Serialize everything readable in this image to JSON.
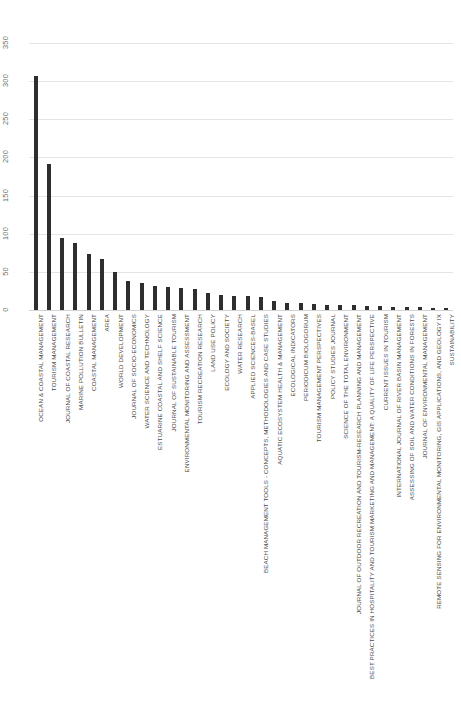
{
  "chart_data": {
    "type": "bar",
    "title": "",
    "subtitle": "",
    "xlabel": "",
    "ylabel": "",
    "ylim": [
      0,
      350
    ],
    "yticks": [
      0,
      50,
      100,
      150,
      200,
      250,
      300,
      350
    ],
    "ytick_labels": [
      "0",
      "50",
      "100",
      "150",
      "200",
      "250",
      "300",
      "350"
    ],
    "grid": true,
    "grid_axis": "y",
    "legend": false,
    "orientation": "vertical",
    "bar_color": "#2e2e2e",
    "grid_color": "#e4e4e4",
    "categories": [
      "OCEAN & COASTAL MANAGEMENT",
      "TOURISM MANAGEMENT",
      "JOURNAL OF COASTAL RESEARCH",
      "MARINE POLLUTION BULLETIN",
      "COASTAL MANAGEMENT",
      "AREA",
      "WORLD DEVELOPMENT",
      "JOURNAL OF SOCIO-ECONOMICS",
      "WATER SCIENCE AND TECHNOLOGY",
      "ESTUARINE COASTAL AND SHELF SCIENCE",
      "JOURNAL OF SUSTAINABLE TOURISM",
      "ENVIRONMENTAL MONITORING AND ASSESSMENT",
      "TOURISM RECREATION RESEARCH",
      "LAND USE POLICY",
      "ECOLOGY AND SOCIETY",
      "WATER RESEARCH",
      "APPLIED SCIENCES-BASEL",
      "BEACH MANAGEMENT TOOLS - CONCEPTS, METHODOLOGIES AND CASE STUDIES",
      "AQUATIC ECOSYSTEM HEALTH & MANAGEMENT",
      "ECOLOGICAL INDICATORS",
      "PERIODICUM BIOLOGORUM",
      "TOURISM MANAGEMENT PERSPECTIVES",
      "POLICY STUDIES JOURNAL",
      "SCIENCE OF THE TOTAL ENVIRONMENT",
      "JOURNAL OF OUTDOOR RECREATION AND TOURISM-RESEARCH PLANNING AND MANAGEMENT",
      "BEST PRACTICES IN HOSPITALITY AND TOURISM MARKETING AND MANAGEMENT: A QUALITY OF LIFE PERSPECTIVE",
      "CURRENT ISSUES IN TOURISM",
      "INTERNATIONAL JOURNAL OF RIVER BASIN MANAGEMENT",
      "ASSESSING OF SOIL AND WATER CONDITIONS IN FORESTS",
      "JOURNAL OF ENVIRONMENTAL MANAGEMENT",
      "REMOTE SENSING FOR ENVIRONMENTAL MONITORING, GIS APPLICATIONS, AND GEOLOGY IX",
      "SUSTAINABILITY"
    ],
    "values": [
      307,
      192,
      95,
      88,
      73,
      67,
      50,
      38,
      36,
      32,
      30,
      29,
      27,
      22,
      20,
      19,
      18,
      17,
      12,
      9,
      9,
      8,
      7,
      7,
      6,
      5,
      5,
      4,
      4,
      4,
      3,
      3
    ]
  }
}
